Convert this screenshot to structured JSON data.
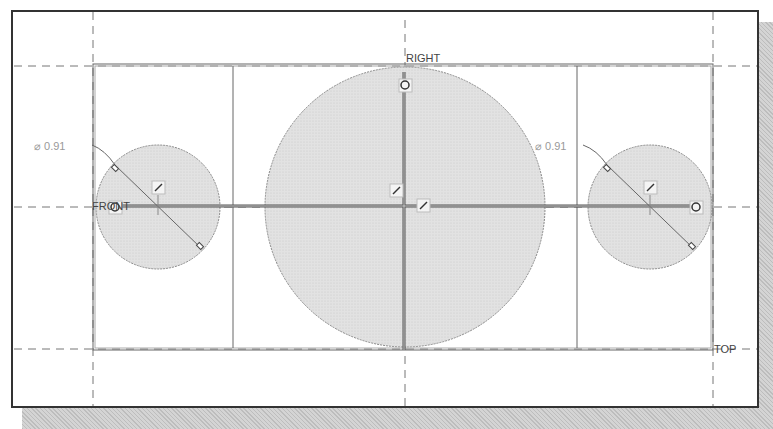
{
  "sketch": {
    "datum_planes": {
      "vertical": "RIGHT",
      "horizontal_left": "FRONT",
      "bottom": "TOP"
    },
    "dimensions": [
      {
        "id": "left-circle-diameter",
        "symbol": "⌀",
        "value": "0.91",
        "text": "⌀ 0.91"
      },
      {
        "id": "right-circle-diameter",
        "symbol": "⌀",
        "value": "0.91",
        "text": "⌀ 0.91"
      }
    ],
    "entities": {
      "large_circle": {
        "cx": 405,
        "cy": 207,
        "r": 140
      },
      "left_circle": {
        "cx": 158,
        "cy": 207,
        "r": 62
      },
      "right_circle": {
        "cx": 650,
        "cy": 207,
        "r": 62
      },
      "rectangle": {
        "x1": 93,
        "y1": 64,
        "x2": 713,
        "y2": 350
      },
      "inner_verticals": [
        233,
        577
      ]
    },
    "colors": {
      "fill": "#dcdcdc",
      "line": "#555555",
      "frame": "#333333"
    }
  }
}
